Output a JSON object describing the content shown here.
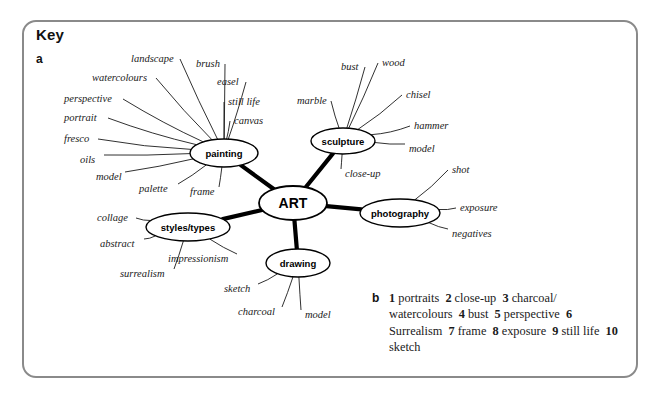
{
  "panel": {
    "title": "Key",
    "part_a_label": "a",
    "part_b_label": "b",
    "border_color": "#8a8a8a"
  },
  "mindmap": {
    "center": {
      "label": "ART",
      "cx": 293,
      "cy": 203,
      "rx": 34,
      "ry": 17
    },
    "branches": [
      {
        "label": "painting",
        "cx": 224,
        "cy": 153,
        "rx": 34,
        "ry": 14,
        "leaves": [
          {
            "label": "landscape",
            "x": 131,
            "y": 62
          },
          {
            "label": "watercolours",
            "x": 92,
            "y": 81
          },
          {
            "label": "perspective",
            "x": 64,
            "y": 102
          },
          {
            "label": "portrait",
            "x": 64,
            "y": 121
          },
          {
            "label": "fresco",
            "x": 64,
            "y": 142
          },
          {
            "label": "oils",
            "x": 80,
            "y": 163
          },
          {
            "label": "model",
            "x": 96,
            "y": 180
          },
          {
            "label": "palette",
            "x": 139,
            "y": 192
          },
          {
            "label": "frame",
            "x": 190,
            "y": 195
          },
          {
            "label": "brush",
            "x": 196,
            "y": 67
          },
          {
            "label": "easel",
            "x": 217,
            "y": 85
          },
          {
            "label": "still life",
            "x": 228,
            "y": 105
          },
          {
            "label": "canvas",
            "x": 234,
            "y": 124
          }
        ]
      },
      {
        "label": "sculpture",
        "cx": 343,
        "cy": 141,
        "rx": 32,
        "ry": 13,
        "leaves": [
          {
            "label": "marble",
            "x": 297,
            "y": 104
          },
          {
            "label": "bust",
            "x": 341,
            "y": 70
          },
          {
            "label": "wood",
            "x": 382,
            "y": 66
          },
          {
            "label": "chisel",
            "x": 406,
            "y": 98
          },
          {
            "label": "hammer",
            "x": 414,
            "y": 129
          },
          {
            "label": "model",
            "x": 409,
            "y": 152
          },
          {
            "label": "close-up",
            "x": 345,
            "y": 177
          }
        ]
      },
      {
        "label": "photography",
        "cx": 400,
        "cy": 213,
        "rx": 40,
        "ry": 14,
        "leaves": [
          {
            "label": "shot",
            "x": 452,
            "y": 173
          },
          {
            "label": "exposure",
            "x": 460,
            "y": 211
          },
          {
            "label": "negatives",
            "x": 452,
            "y": 237
          }
        ]
      },
      {
        "label": "drawing",
        "cx": 298,
        "cy": 263,
        "rx": 32,
        "ry": 14,
        "leaves": [
          {
            "label": "sketch",
            "x": 224,
            "y": 292
          },
          {
            "label": "charcoal",
            "x": 238,
            "y": 315
          },
          {
            "label": "model",
            "x": 305,
            "y": 318
          }
        ]
      },
      {
        "label": "styles/types",
        "cx": 188,
        "cy": 227,
        "rx": 42,
        "ry": 14,
        "leaves": [
          {
            "label": "collage",
            "x": 97,
            "y": 221
          },
          {
            "label": "abstract",
            "x": 100,
            "y": 247
          },
          {
            "label": "surrealism",
            "x": 120,
            "y": 277
          },
          {
            "label": "impressionism",
            "x": 168,
            "y": 262
          }
        ]
      }
    ]
  },
  "answers": {
    "items": [
      {
        "num": "1",
        "text": "portraits"
      },
      {
        "num": "2",
        "text": "close-up"
      },
      {
        "num": "3",
        "text": "charcoal/ watercolours"
      },
      {
        "num": "4",
        "text": "bust"
      },
      {
        "num": "5",
        "text": "perspective"
      },
      {
        "num": "6",
        "text": "Surrealism"
      },
      {
        "num": "7",
        "text": "frame"
      },
      {
        "num": "8",
        "text": "exposure"
      },
      {
        "num": "9",
        "text": "still life"
      },
      {
        "num": "10",
        "text": "sketch"
      }
    ],
    "full_text": "1 portraits  2 close-up  3 charcoal/ watercolours  4 bust  5 perspective  6 Surrealism  7 frame  8 exposure  9 still life  10 sketch"
  }
}
